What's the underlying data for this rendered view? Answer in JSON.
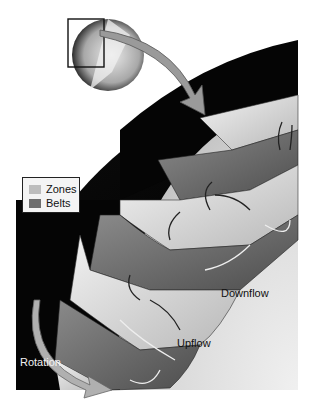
{
  "figure": {
    "style": "grayscale illustration"
  },
  "legend": {
    "items": [
      {
        "label": "Zones",
        "color": "#bdbdbd"
      },
      {
        "label": "Belts",
        "color": "#6e6e6e"
      }
    ]
  },
  "annotations": {
    "downflow": "Downflow",
    "upflow": "Upflow",
    "rotation": "Rotation"
  },
  "colors": {
    "background": "#ffffff",
    "space": "#050505",
    "zone": "#d6d6d6",
    "belt": "#6a6a6a",
    "planet_interior": "#dcdcdc",
    "arrow": "#8a8a8a"
  }
}
